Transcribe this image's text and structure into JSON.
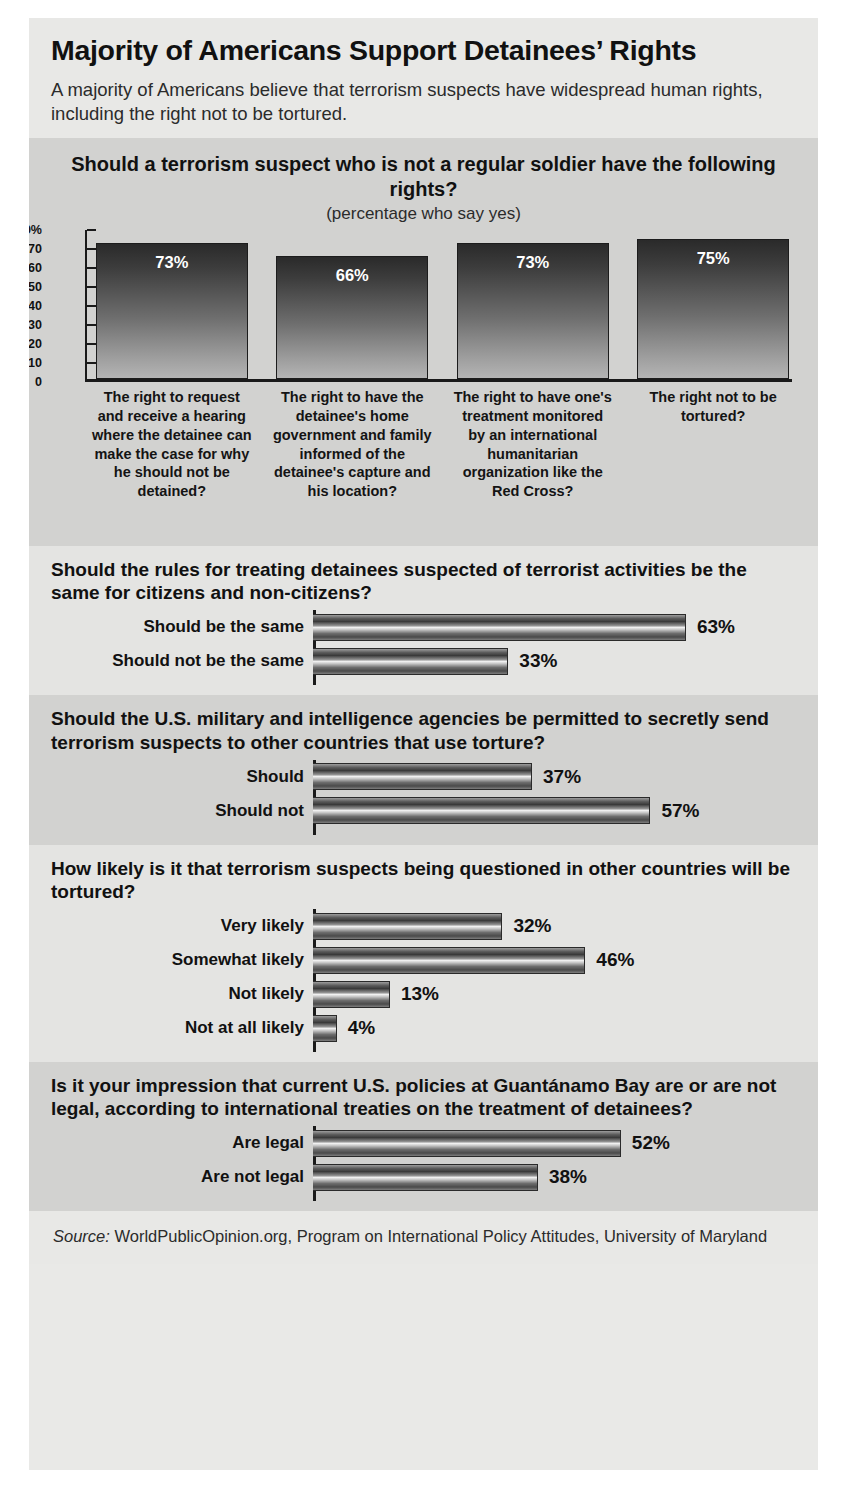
{
  "header": {
    "title": "Majority of Americans Support Detainees’ Rights",
    "subtitle": "A majority of Americans believe that terrorism suspects have widespread human rights, including the right not to be tortured."
  },
  "source": {
    "label": "Source:",
    "text": " WorldPublicOpinion.org, Program on International Policy Attitudes, University of Maryland"
  },
  "chart_data": [
    {
      "type": "bar",
      "title": "Should a terrorism suspect who is not a regular soldier have the following rights?",
      "subtitle": "(percentage who say yes)",
      "orientation": "vertical",
      "categories": [
        "The right to request and receive a hearing where the detainee can make the case for why he should not be detained?",
        "The right to have the detainee's home government and family informed of the detainee's capture and his location?",
        "The right to have one's treatment monitored by an international humanitarian organization like the Red Cross?",
        "The right not to be tortured?"
      ],
      "values": [
        73,
        66,
        73,
        75
      ],
      "value_labels": [
        "73%",
        "66%",
        "73%",
        "75%"
      ],
      "ylabel": "",
      "xlabel": "",
      "ylim": [
        0,
        80
      ],
      "yticks": [
        80,
        70,
        60,
        50,
        40,
        30,
        20,
        10,
        0
      ],
      "ytick_labels": [
        "80%",
        "70",
        "60",
        "50",
        "40",
        "30",
        "20",
        "10",
        "0"
      ],
      "grid": false,
      "legend": "none"
    },
    {
      "type": "bar",
      "orientation": "horizontal",
      "title": "Should the rules for treating detainees suspected of terrorist activities be the same for citizens and non-citizens?",
      "categories": [
        "Should be the same",
        "Should not be the same"
      ],
      "values": [
        63,
        33
      ],
      "value_labels": [
        "63%",
        "33%"
      ],
      "xlim": [
        0,
        70
      ],
      "grid": false,
      "legend": "none"
    },
    {
      "type": "bar",
      "orientation": "horizontal",
      "title": "Should the U.S. military and intelligence agencies be permitted to secretly send terrorism suspects to other countries that use torture?",
      "categories": [
        "Should",
        "Should not"
      ],
      "values": [
        37,
        57
      ],
      "value_labels": [
        "37%",
        "57%"
      ],
      "xlim": [
        0,
        70
      ],
      "grid": false,
      "legend": "none"
    },
    {
      "type": "bar",
      "orientation": "horizontal",
      "title": "How likely is it that terrorism suspects being questioned in other countries will be tortured?",
      "categories": [
        "Very likely",
        "Somewhat likely",
        "Not likely",
        "Not at all likely"
      ],
      "values": [
        32,
        46,
        13,
        4
      ],
      "value_labels": [
        "32%",
        "46%",
        "13%",
        "4%"
      ],
      "xlim": [
        0,
        70
      ],
      "grid": false,
      "legend": "none"
    },
    {
      "type": "bar",
      "orientation": "horizontal",
      "title": "Is it your impression that current U.S. policies at Guantánamo Bay are or are not legal, according to international treaties on the treatment of detainees?",
      "categories": [
        "Are legal",
        "Are not legal"
      ],
      "values": [
        52,
        38
      ],
      "value_labels": [
        "52%",
        "38%"
      ],
      "xlim": [
        0,
        70
      ],
      "grid": false,
      "legend": "none"
    }
  ],
  "colors": {
    "page_background": "#ffffff",
    "section_dark": "#d2d2d0",
    "section_light": "#e4e4e2",
    "header_background": "#e8e8e6",
    "text": "#111111",
    "bar_dark": "#2a2a2a",
    "bar_light": "#f0f0f0"
  }
}
